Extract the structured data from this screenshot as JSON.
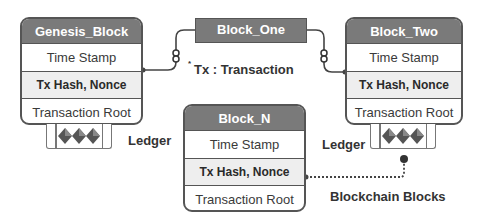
{
  "blocks": {
    "genesis": {
      "title": "Genesis_Block",
      "rows": [
        "Time Stamp",
        "Tx Hash, Nonce",
        "Transaction Root"
      ]
    },
    "block_one": {
      "title": "Block_One"
    },
    "block_two": {
      "title": "Block_Two",
      "rows": [
        "Time Stamp",
        "Tx Hash, Nonce",
        "Transaction Root"
      ]
    },
    "block_n": {
      "title": "Block_N",
      "rows": [
        "Time Stamp",
        "Tx Hash, Nonce",
        "Transaction Root"
      ]
    }
  },
  "labels": {
    "legend": "Tx : Transaction",
    "legend_marker": "*",
    "ledger_left": "Ledger",
    "ledger_right": "Ledger",
    "caption": "Blockchain Blocks"
  },
  "icons": {
    "ledger": "ledger-diamonds-icon",
    "chain_link": "chain-link-icon"
  },
  "colors": {
    "header_fill": "#7a7a7a",
    "border": "#555555",
    "hash_row_fill": "#eeeeee",
    "text": "#333333"
  }
}
